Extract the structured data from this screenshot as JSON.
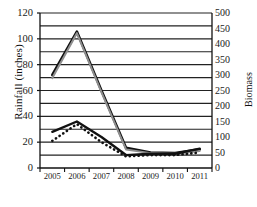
{
  "chart_data": {
    "type": "line",
    "title": "",
    "xlabel": "",
    "ylabel": "Rainfall (inches)",
    "y2label": "Biomass",
    "categories": [
      "2005",
      "2006",
      "2007",
      "2008",
      "2009",
      "2010",
      "2011"
    ],
    "x": [
      2005,
      2006,
      2007,
      2008,
      2009,
      2010,
      2011
    ],
    "ylim": [
      0,
      120
    ],
    "y2lim": [
      0,
      500
    ],
    "yticks": [
      0,
      20,
      40,
      60,
      80,
      100,
      120
    ],
    "ytick_labels": [
      "0",
      "20",
      "40",
      "60",
      "80",
      "100",
      "120"
    ],
    "y2ticks": [
      0,
      50,
      100,
      150,
      200,
      250,
      300,
      350,
      400,
      450,
      500
    ],
    "y2tick_labels": [
      "0",
      "50",
      "100",
      "150",
      "200",
      "250",
      "300",
      "350",
      "400",
      "450",
      "500"
    ],
    "gridlines": {
      "horizontal": true,
      "interval": 10,
      "vertical": false
    },
    "legend": {
      "visible": false,
      "position": "none"
    },
    "series": [
      {
        "name": "biomass-peak-black",
        "axis": "right",
        "style": "solid",
        "color": "#111111",
        "width": 2.6,
        "values": [
          300,
          440,
          250,
          65,
          50,
          48,
          60
        ],
        "values_left_scale": [
          72,
          105.6,
          60,
          15.6,
          12,
          11.5,
          14.4
        ]
      },
      {
        "name": "biomass-peak-gray",
        "axis": "right",
        "style": "solid",
        "color": "#8f8f8f",
        "width": 2.0,
        "values": [
          290,
          435,
          245,
          60,
          48,
          46,
          55
        ],
        "values_left_scale": [
          69.6,
          104.4,
          58.8,
          14.4,
          11.5,
          11,
          13.2
        ]
      },
      {
        "name": "rainfall-solid",
        "axis": "left",
        "style": "solid",
        "color": "#111111",
        "width": 2.4,
        "values": [
          28,
          36,
          24,
          10,
          11,
          11,
          15
        ]
      },
      {
        "name": "rainfall-dotted",
        "axis": "left",
        "style": "dotted",
        "color": "#111111",
        "width": 2.6,
        "values": [
          21,
          34,
          20,
          9,
          10,
          10,
          12
        ]
      }
    ],
    "annotations": []
  },
  "axes": {
    "left": {
      "title": "Rainfall (inches)",
      "ticks": [
        "0",
        "20",
        "40",
        "60",
        "80",
        "100",
        "120"
      ]
    },
    "right": {
      "title": "Biomass",
      "ticks": [
        "0",
        "50",
        "100",
        "150",
        "200",
        "250",
        "300",
        "350",
        "400",
        "450",
        "500"
      ]
    },
    "bottom": {
      "title": "",
      "ticks": [
        "2005",
        "2006",
        "2007",
        "2008",
        "2009",
        "2010",
        "2011"
      ]
    }
  },
  "colors": {
    "background": "#ffffff",
    "axis": "#111111",
    "grid": "#222222",
    "series_black": "#111111",
    "series_gray": "#8f8f8f"
  }
}
